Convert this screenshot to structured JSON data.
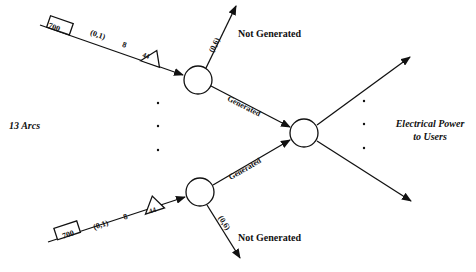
{
  "diagram": {
    "left_label": "13 Arcs",
    "right_label_line1": "Electrical Power",
    "right_label_line2": "to Users",
    "top_arc": {
      "box_value": "700",
      "bounds": "(0,1)",
      "cost": "8",
      "triangle_value": "44",
      "not_generated_bounds": "(0,6)",
      "not_generated_label": "Not Generated",
      "generated_label": "Generated"
    },
    "bottom_arc": {
      "box_value": "700",
      "bounds": "(0,1)",
      "cost": "8",
      "triangle_value": "44",
      "not_generated_bounds": "(0,6)",
      "not_generated_label": "Not Generated",
      "generated_label": "Generated"
    },
    "ellipsis": "·"
  }
}
